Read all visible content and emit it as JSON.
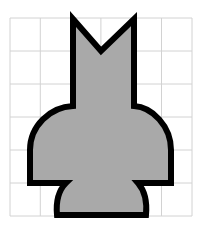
{
  "figure": {
    "canvas": {
      "width": 202,
      "height": 230,
      "background_color": "#ffffff"
    },
    "grid": {
      "name": "square-grid",
      "line_color": "#d2d2d2",
      "line_width": 1,
      "columns": 6,
      "rows": 6,
      "cell_width": 30.3,
      "cell_height": 33.0,
      "x_start": 10,
      "y_start": 18,
      "x_end": 192,
      "y_end": 216,
      "x_lines": [
        10,
        40.3,
        70.6,
        100.9,
        131.2,
        161.5,
        192
      ],
      "y_lines": [
        18,
        51,
        84,
        117,
        150,
        183,
        216
      ]
    },
    "shape": {
      "name": "chess-piece-silhouette",
      "fill_color": "#a9a9a9",
      "stroke_color": "#000000",
      "stroke_width": 6,
      "symmetry_axis_x": 101,
      "parts": [
        {
          "name": "left-peak",
          "apex_x": 73,
          "apex_y": 19
        },
        {
          "name": "v-notch",
          "bottom_x": 101,
          "bottom_y": 51
        },
        {
          "name": "right-peak",
          "apex_x": 134,
          "apex_y": 19
        },
        {
          "name": "neck",
          "left_x": 73,
          "right_x": 134,
          "top_y": 19,
          "bottom_y": 106
        },
        {
          "name": "dome-body",
          "left_x": 30,
          "right_x": 171,
          "top_y": 106,
          "bottom_y": 183
        },
        {
          "name": "flared-base",
          "top_left_x": 66,
          "top_right_x": 138,
          "bottom_left_x": 57,
          "bottom_right_x": 146,
          "top_y": 183,
          "bottom_y": 215
        }
      ],
      "path": "M 73 19 L 101 51 L 134 19 L 134 106 C 152 107 171 126 171 150 L 171 183 L 138 183 C 145 191 147 204 146 215 L 57 215 C 56 204 58 191 66 183 L 30 183 L 30 150 C 30 126 50 107 73 106 Z"
    }
  }
}
